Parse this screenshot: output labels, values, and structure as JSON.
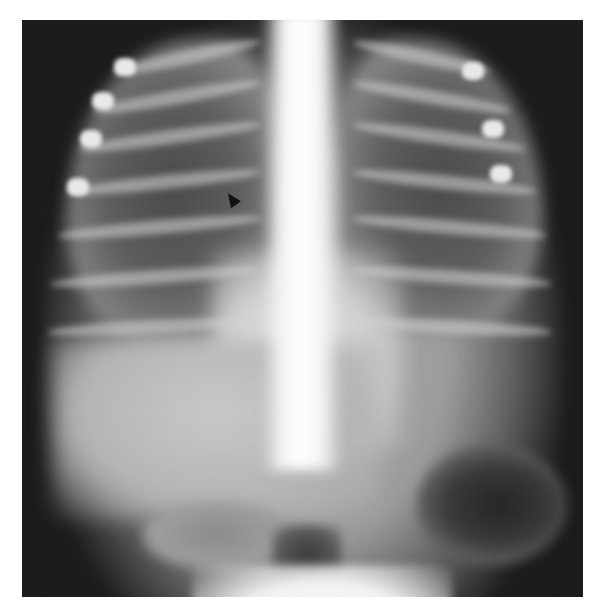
{
  "image": {
    "type": "radiograph",
    "view": "frontal chest and upper abdomen",
    "background_color": "#ffffff",
    "film_color_dark": "#1c1c1c",
    "annotations": [
      {
        "kind": "arrowhead",
        "color": "#111111",
        "position": {
          "x": 230,
          "y": 200
        }
      }
    ]
  },
  "anatomy_regions": [
    {
      "name": "right-lung",
      "appearance": "dark, air-filled"
    },
    {
      "name": "left-lung",
      "appearance": "dark, air-filled"
    },
    {
      "name": "mediastinum",
      "appearance": "bright midline"
    },
    {
      "name": "ribs",
      "appearance": "bright curved bands"
    },
    {
      "name": "liver",
      "appearance": "homogeneous gray"
    },
    {
      "name": "stomach-gas-bubble",
      "appearance": "dark oval, lower right of image"
    }
  ]
}
